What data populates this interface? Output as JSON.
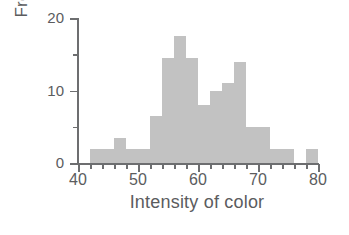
{
  "chart_data": {
    "type": "bar",
    "title": "",
    "subtitle": "",
    "xlabel": "Intensity of color",
    "ylabel": "Frequency (%)",
    "xlim": [
      40,
      80
    ],
    "ylim": [
      0,
      20
    ],
    "grid": false,
    "legend": null,
    "bin_width": 2,
    "bar_color": "#c2c2c2",
    "axis_color": "#6d6e70",
    "text_color": "#5b5c5e",
    "xticks_major": [
      40,
      50,
      60,
      70,
      80
    ],
    "xticks_major_labels": [
      "40",
      "50",
      "60",
      "70",
      "80"
    ],
    "xticks_minor": [
      42,
      44,
      46,
      48,
      52,
      54,
      56,
      58,
      62,
      64,
      66,
      68,
      72,
      74,
      76,
      78
    ],
    "yticks_major": [
      0,
      10,
      20
    ],
    "yticks_major_labels": [
      "0",
      "10",
      "20"
    ],
    "yticks_minor": [
      5,
      15
    ],
    "bins": [
      {
        "x0": 42,
        "x1": 44,
        "value": 2.0
      },
      {
        "x0": 44,
        "x1": 46,
        "value": 2.0
      },
      {
        "x0": 46,
        "x1": 48,
        "value": 3.5
      },
      {
        "x0": 48,
        "x1": 50,
        "value": 2.0
      },
      {
        "x0": 50,
        "x1": 52,
        "value": 2.0
      },
      {
        "x0": 52,
        "x1": 54,
        "value": 6.5
      },
      {
        "x0": 54,
        "x1": 56,
        "value": 14.5
      },
      {
        "x0": 56,
        "x1": 58,
        "value": 17.5
      },
      {
        "x0": 58,
        "x1": 60,
        "value": 14.5
      },
      {
        "x0": 60,
        "x1": 62,
        "value": 8.0
      },
      {
        "x0": 62,
        "x1": 64,
        "value": 10.0
      },
      {
        "x0": 64,
        "x1": 66,
        "value": 11.0
      },
      {
        "x0": 66,
        "x1": 68,
        "value": 14.0
      },
      {
        "x0": 68,
        "x1": 70,
        "value": 5.0
      },
      {
        "x0": 70,
        "x1": 72,
        "value": 5.0
      },
      {
        "x0": 72,
        "x1": 74,
        "value": 2.0
      },
      {
        "x0": 74,
        "x1": 76,
        "value": 2.0
      },
      {
        "x0": 76,
        "x1": 78,
        "value": 0.0
      },
      {
        "x0": 78,
        "x1": 80,
        "value": 2.0
      }
    ],
    "categories": [
      "42-44",
      "44-46",
      "46-48",
      "48-50",
      "50-52",
      "52-54",
      "54-56",
      "56-58",
      "58-60",
      "60-62",
      "62-64",
      "64-66",
      "66-68",
      "68-70",
      "70-72",
      "72-74",
      "74-76",
      "76-78",
      "78-80"
    ],
    "values": [
      2.0,
      2.0,
      3.5,
      2.0,
      2.0,
      6.5,
      14.5,
      17.5,
      14.5,
      8.0,
      10.0,
      11.0,
      14.0,
      5.0,
      5.0,
      2.0,
      2.0,
      0.0,
      2.0
    ]
  }
}
